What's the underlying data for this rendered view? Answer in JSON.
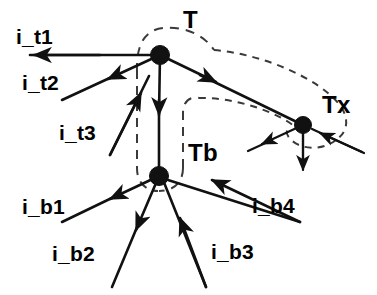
{
  "figure": {
    "type": "node-link-diagram",
    "background_color": "#ffffff",
    "ink_color": "#111111",
    "dashed_group_color": "#3a3a3a",
    "width": 377,
    "height": 295
  },
  "nodes": [
    {
      "id": "T",
      "label": "T",
      "x": 160,
      "y": 55,
      "radius": 9
    },
    {
      "id": "Tb",
      "label": "Tb",
      "x": 159,
      "y": 176,
      "radius": 9
    },
    {
      "id": "Tx",
      "label": "Tx",
      "x": 303,
      "y": 125,
      "radius": 9
    }
  ],
  "group_labels": {
    "t": {
      "text": "T",
      "x": 183,
      "y": 10
    },
    "tb": {
      "text": "Tb",
      "x": 188,
      "y": 143
    },
    "tx": {
      "text": "Tx",
      "x": 322,
      "y": 95
    }
  },
  "port_labels": [
    {
      "id": "i_t1",
      "text": "i_t1",
      "x": 16,
      "y": 26
    },
    {
      "id": "i_t2",
      "text": "i_t2",
      "x": 22,
      "y": 72
    },
    {
      "id": "i_t3",
      "text": "i_t3",
      "x": 59,
      "y": 122
    },
    {
      "id": "i_b1",
      "text": "i_b1",
      "x": 22,
      "y": 196
    },
    {
      "id": "i_b2",
      "text": "i_b2",
      "x": 52,
      "y": 243
    },
    {
      "id": "i_b3",
      "text": "i_b3",
      "x": 211,
      "y": 241
    },
    {
      "id": "i_b4",
      "text": "i_b4",
      "x": 252,
      "y": 195
    }
  ],
  "edges": [
    {
      "id": "edge-i_t1",
      "from_node": "T",
      "label": "i_t1",
      "direction": "outgoing",
      "x1": 160,
      "y1": 55,
      "x2": 30,
      "y2": 55
    },
    {
      "id": "edge-i_t2",
      "from_node": "T",
      "label": "i_t2",
      "direction": "outgoing",
      "x1": 160,
      "y1": 55,
      "x2": 62,
      "y2": 100
    },
    {
      "id": "edge-i_t3",
      "to_node": "T",
      "label": "i_t3",
      "direction": "incoming",
      "x1": 110,
      "y1": 155,
      "x2": 160,
      "y2": 55
    },
    {
      "id": "edge-T-Tb",
      "from_node": "T",
      "to_node": "Tb",
      "direction": "outgoing",
      "x1": 160,
      "y1": 55,
      "x2": 159,
      "y2": 176
    },
    {
      "id": "edge-T-Tx",
      "from_node": "T",
      "to_node": "Tx",
      "direction": "outgoing",
      "x1": 160,
      "y1": 55,
      "x2": 303,
      "y2": 125
    },
    {
      "id": "edge-i_b1",
      "from_node": "Tb",
      "label": "i_b1",
      "direction": "outgoing",
      "x1": 159,
      "y1": 176,
      "x2": 62,
      "y2": 222
    },
    {
      "id": "edge-i_b2",
      "from_node": "Tb",
      "label": "i_b2",
      "direction": "outgoing",
      "x1": 159,
      "y1": 176,
      "x2": 112,
      "y2": 285
    },
    {
      "id": "edge-i_b3",
      "to_node": "Tb",
      "label": "i_b3",
      "direction": "incoming",
      "x1": 206,
      "y1": 285,
      "x2": 159,
      "y2": 176
    },
    {
      "id": "edge-i_b4",
      "to_node": "Tb",
      "label": "i_b4",
      "direction": "incoming",
      "x1": 300,
      "y1": 222,
      "x2": 159,
      "y2": 176
    },
    {
      "id": "edge-Tx-out-left",
      "from_node": "Tx",
      "direction": "outgoing",
      "x1": 303,
      "y1": 125,
      "x2": 250,
      "y2": 150
    },
    {
      "id": "edge-Tx-in-right",
      "to_node": "Tx",
      "direction": "incoming",
      "x1": 362,
      "y1": 152,
      "x2": 303,
      "y2": 125
    },
    {
      "id": "edge-Tx-out-down",
      "from_node": "Tx",
      "direction": "outgoing",
      "x1": 303,
      "y1": 125,
      "x2": 303,
      "y2": 172
    }
  ],
  "dashed_groups": [
    {
      "id": "group-T",
      "label": "T",
      "encloses": [
        "T"
      ]
    },
    {
      "id": "group-Tb",
      "label": "Tb",
      "encloses": [
        "Tb"
      ]
    },
    {
      "id": "group-Tx",
      "label": "Tx",
      "encloses": [
        "Tx"
      ]
    }
  ]
}
